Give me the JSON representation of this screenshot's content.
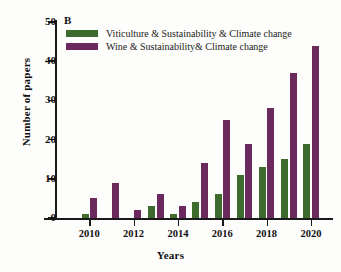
{
  "chart_data": {
    "type": "bar",
    "title": "",
    "panel_label": "B",
    "xlabel": "Years",
    "ylabel": "Number of papers",
    "categories": [
      "2009",
      "2010",
      "2011",
      "2012",
      "2013",
      "2014",
      "2015",
      "2016",
      "2017",
      "2018",
      "2019",
      "2020"
    ],
    "xtick_labels": [
      "2010",
      "2012",
      "2014",
      "2016",
      "2018",
      "2020"
    ],
    "ytick_labels": [
      "0",
      "10",
      "20",
      "30",
      "40",
      "50"
    ],
    "ytick_values": [
      0,
      10,
      20,
      30,
      40,
      50
    ],
    "ylim": [
      0,
      50
    ],
    "grid": false,
    "legend_position": "top-left",
    "series": [
      {
        "name": "Viticulture & Sustainability & Climate change",
        "color": "#3d6b2e",
        "values": [
          0,
          1,
          0,
          0,
          3,
          1,
          4,
          6,
          11,
          13,
          15,
          19
        ]
      },
      {
        "name": "Wine & Sustainability& Climate change",
        "color": "#6b2a5e",
        "values": [
          0,
          5,
          9,
          2,
          6,
          3,
          14,
          25,
          19,
          28,
          37,
          44
        ]
      }
    ]
  }
}
